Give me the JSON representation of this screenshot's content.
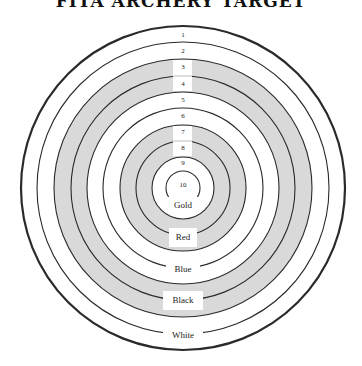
{
  "title": "FITA ARCHERY TARGET",
  "target": {
    "center": [
      183,
      188
    ],
    "rings": [
      {
        "score": "1",
        "radius": 162,
        "fill": "#ffffff",
        "label_y": 37
      },
      {
        "score": "2",
        "radius": 146,
        "fill": "#ffffff",
        "label_y": 53
      },
      {
        "score": "3",
        "radius": 129,
        "fill": "#d9d9d9",
        "label_y": 69
      },
      {
        "score": "4",
        "radius": 112,
        "fill": "#d9d9d9",
        "label_y": 86
      },
      {
        "score": "5",
        "radius": 96,
        "fill": "#ffffff",
        "label_y": 102
      },
      {
        "score": "6",
        "radius": 80,
        "fill": "#ffffff",
        "label_y": 118
      },
      {
        "score": "7",
        "radius": 63,
        "fill": "#d9d9d9",
        "label_y": 134
      },
      {
        "score": "8",
        "radius": 47,
        "fill": "#d9d9d9",
        "label_y": 150
      },
      {
        "score": "9",
        "radius": 31,
        "fill": "#ffffff",
        "label_y": 165
      },
      {
        "score": "10",
        "radius": 17,
        "fill": "#ffffff",
        "label_y": 187
      }
    ],
    "colour_zones": [
      {
        "name": "Gold",
        "label_y": 208,
        "boxed": false
      },
      {
        "name": "Red",
        "label_y": 240,
        "boxed": true
      },
      {
        "name": "Blue",
        "label_y": 272,
        "boxed": false
      },
      {
        "name": "Black",
        "label_y": 303,
        "boxed": true
      },
      {
        "name": "White",
        "label_y": 338,
        "boxed": false
      }
    ],
    "colors": {
      "stroke": "#2a2a2a",
      "shaded": "#d9d9d9",
      "background": "#ffffff"
    }
  }
}
